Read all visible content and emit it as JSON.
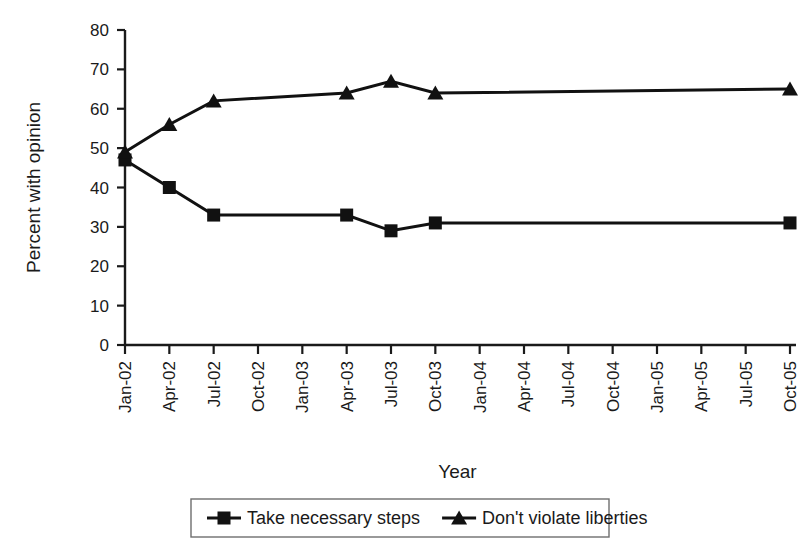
{
  "chart_data": {
    "type": "line",
    "title": "",
    "xlabel": "Year",
    "ylabel": "Percent with opinion",
    "ylim": [
      0,
      80
    ],
    "ytick_step": 10,
    "yticks": [
      0,
      10,
      20,
      30,
      40,
      50,
      60,
      70,
      80
    ],
    "grid": false,
    "legend_position": "bottom",
    "categories": [
      "Jan-02",
      "Apr-02",
      "Jul-02",
      "Oct-02",
      "Jan-03",
      "Apr-03",
      "Jul-03",
      "Oct-03",
      "Jan-04",
      "Apr-04",
      "Jul-04",
      "Oct-04",
      "Jan-05",
      "Apr-05",
      "Jul-05",
      "Oct-05"
    ],
    "series": [
      {
        "name": "Take necessary steps",
        "marker": "square",
        "color": "#111111",
        "points": [
          {
            "x": "Jan-02",
            "y": 47
          },
          {
            "x": "Apr-02",
            "y": 40
          },
          {
            "x": "Jul-02",
            "y": 33
          },
          {
            "x": "Apr-03",
            "y": 33
          },
          {
            "x": "Jul-03",
            "y": 29
          },
          {
            "x": "Oct-03",
            "y": 31
          },
          {
            "x": "Oct-05",
            "y": 31
          }
        ]
      },
      {
        "name": "Don't violate liberties",
        "marker": "triangle",
        "color": "#111111",
        "points": [
          {
            "x": "Jan-02",
            "y": 49
          },
          {
            "x": "Apr-02",
            "y": 56
          },
          {
            "x": "Jul-02",
            "y": 62
          },
          {
            "x": "Apr-03",
            "y": 64
          },
          {
            "x": "Jul-03",
            "y": 67
          },
          {
            "x": "Oct-03",
            "y": 64
          },
          {
            "x": "Oct-05",
            "y": 65
          }
        ]
      }
    ]
  },
  "legend": {
    "items": [
      {
        "label": "Take necessary steps",
        "marker": "square-marker-icon"
      },
      {
        "label": "Don't violate liberties",
        "marker": "triangle-marker-icon"
      }
    ]
  }
}
